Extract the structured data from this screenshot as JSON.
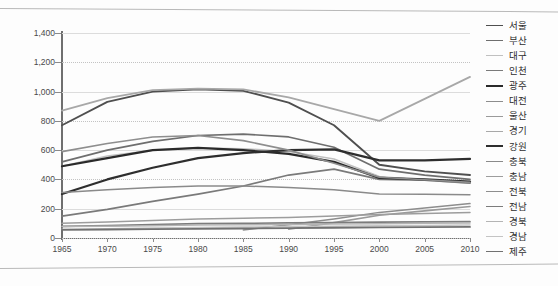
{
  "chart_data": {
    "type": "line",
    "title": "",
    "xlabel": "",
    "ylabel": "",
    "x": [
      1965,
      1970,
      1975,
      1980,
      1985,
      1990,
      1995,
      2000,
      2005,
      2010
    ],
    "xlim": [
      1965,
      2010
    ],
    "ylim": [
      0,
      1400
    ],
    "yticks": [
      0,
      200,
      400,
      600,
      800,
      1000,
      1200,
      1400
    ],
    "ytick_labels": [
      "0",
      "200",
      "400",
      "600",
      "800",
      "1,000",
      "1,200",
      "1,400"
    ],
    "xtick_labels": [
      "1965",
      "1970",
      "1975",
      "1980",
      "1985",
      "1990",
      "1995",
      "2000",
      "2005",
      "2010"
    ],
    "grid": true,
    "legend_position": "right",
    "series": [
      {
        "name": "서울",
        "color": "#4f4f4f",
        "width": 1.9,
        "values": [
          770,
          930,
          1000,
          1015,
          1005,
          925,
          770,
          500,
          455,
          430
        ]
      },
      {
        "name": "부산",
        "color": "#6e6e6e",
        "width": 1.7,
        "values": [
          520,
          600,
          660,
          700,
          710,
          690,
          620,
          470,
          430,
          400
        ]
      },
      {
        "name": "대구",
        "color": "#c0c0c0",
        "width": 1.5,
        "values": [
          490,
          560,
          600,
          615,
          610,
          590,
          540,
          420,
          395,
          375
        ]
      },
      {
        "name": "인천",
        "color": "#7a7a7a",
        "width": 1.7,
        "values": [
          150,
          195,
          250,
          300,
          355,
          430,
          470,
          400,
          395,
          375
        ]
      },
      {
        "name": "광주",
        "color": "#2a2a2a",
        "width": 2.2,
        "values": [
          490,
          545,
          600,
          615,
          600,
          575,
          520,
          410,
          400,
          385
        ]
      },
      {
        "name": "대전",
        "color": "#8d8d8d",
        "width": 1.5,
        "values": [
          null,
          null,
          null,
          null,
          55,
          90,
          130,
          175,
          205,
          235
        ]
      },
      {
        "name": "울산",
        "color": "#9a9a9a",
        "width": 1.6,
        "values": [
          null,
          null,
          null,
          null,
          null,
          60,
          105,
          155,
          185,
          215
        ]
      },
      {
        "name": "경기",
        "color": "#a8a8a8",
        "width": 1.8,
        "values": [
          870,
          955,
          1010,
          1020,
          1015,
          960,
          880,
          800,
          950,
          1100
        ]
      },
      {
        "name": "강원",
        "color": "#2e2e2e",
        "width": 2.2,
        "values": [
          300,
          400,
          480,
          545,
          580,
          600,
          605,
          530,
          530,
          540
        ]
      },
      {
        "name": "충북",
        "color": "#8a8a8a",
        "width": 1.5,
        "values": [
          310,
          330,
          345,
          355,
          355,
          345,
          330,
          300,
          298,
          295
        ]
      },
      {
        "name": "충남",
        "color": "#9d9d9d",
        "width": 1.5,
        "values": [
          100,
          110,
          120,
          130,
          135,
          140,
          150,
          160,
          168,
          175
        ]
      },
      {
        "name": "전북",
        "color": "#8e8e8e",
        "width": 1.6,
        "values": [
          590,
          645,
          690,
          700,
          665,
          600,
          510,
          415,
          398,
          380
        ]
      },
      {
        "name": "전남",
        "color": "#7c7c7c",
        "width": 1.7,
        "values": [
          80,
          85,
          92,
          98,
          100,
          103,
          105,
          108,
          110,
          112
        ]
      },
      {
        "name": "경북",
        "color": "#b4b4b4",
        "width": 1.5,
        "values": [
          78,
          80,
          84,
          88,
          90,
          92,
          95,
          98,
          100,
          102
        ]
      },
      {
        "name": "경남",
        "color": "#c4c4c4",
        "width": 1.5,
        "values": [
          60,
          64,
          68,
          72,
          75,
          78,
          80,
          84,
          86,
          88
        ]
      },
      {
        "name": "제주",
        "color": "#717171",
        "width": 1.8,
        "values": [
          55,
          58,
          60,
          63,
          65,
          67,
          70,
          72,
          74,
          76
        ]
      }
    ]
  }
}
